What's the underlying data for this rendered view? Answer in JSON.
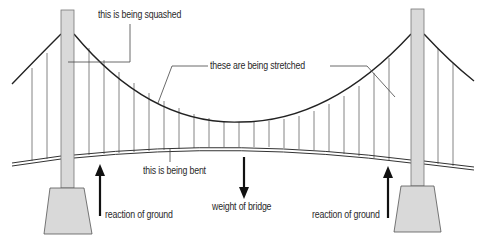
{
  "labels": {
    "tower": "this is being squashed",
    "hangers": "these are being stretched",
    "deck": "this is being bent",
    "weight": "weight of bridge",
    "reaction_left": "reaction of ground",
    "reaction_right": "reaction of ground"
  },
  "colors": {
    "tower_fill": "#d9d9d9",
    "line": "#222222",
    "hanger": "#555555"
  }
}
